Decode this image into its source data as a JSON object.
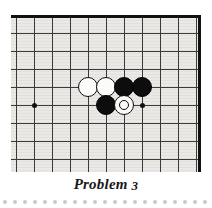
{
  "page": {
    "type": "go-problem-diagram",
    "caption_prefix": "Problem",
    "caption_number": "3"
  },
  "board": {
    "label": "go-board",
    "background_color": "#e8e7e3",
    "line_color": "#3a3a3a",
    "edge_color": "#111111",
    "columns": 11,
    "rows": 9,
    "cell_size": 18,
    "origin_x": 5,
    "origin_y": 18,
    "edges_visible": [
      "top",
      "right"
    ],
    "star_points": [
      {
        "name": "star-point-left",
        "col": 1,
        "row": 4
      },
      {
        "name": "star-point-right",
        "col": 7,
        "row": 4
      }
    ],
    "stones": [
      {
        "name": "white-stone-a",
        "color": "white",
        "col": 4,
        "row": 3,
        "marked": false
      },
      {
        "name": "white-stone-b",
        "color": "white",
        "col": 5,
        "row": 3,
        "marked": false
      },
      {
        "name": "black-stone-a",
        "color": "black",
        "col": 6,
        "row": 3,
        "marked": false
      },
      {
        "name": "black-stone-b",
        "color": "black",
        "col": 7,
        "row": 3,
        "marked": false
      },
      {
        "name": "black-stone-c",
        "color": "black",
        "col": 5,
        "row": 4,
        "marked": false
      },
      {
        "name": "white-stone-marked",
        "color": "white",
        "col": 6,
        "row": 4,
        "marked": true
      }
    ]
  },
  "decoration": {
    "dot_rule_color": "#c9c9c9",
    "dot_count": 21,
    "dot_spacing": 10
  }
}
